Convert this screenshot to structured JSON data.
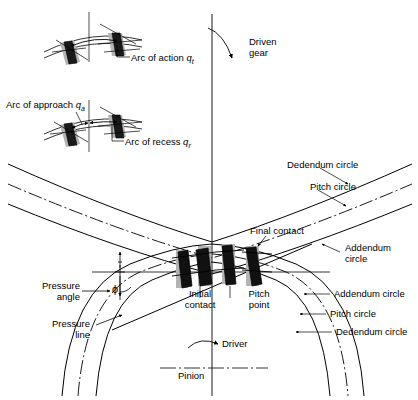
{
  "figure": {
    "ink_color": "#000000",
    "tooth_fill": "#1a1a1a",
    "shade_color": "#b4b4b4"
  },
  "insets": {
    "arc_of_action": {
      "label": "Arc of action ",
      "symbol": "q",
      "subscript": "t"
    },
    "arc_of_approach": {
      "label": "Arc of approach ",
      "symbol": "q",
      "subscript": "a"
    },
    "arc_of_recess": {
      "label": "Arc of recess ",
      "symbol": "q",
      "subscript": "r"
    }
  },
  "main": {
    "driven_gear": "Driven\ngear",
    "driver": "Driver",
    "pinion": "Pinion",
    "final_contact": "Final contact",
    "initial_contact": "Initial\ncontact",
    "pitch_point": "Pitch\npoint",
    "pressure_angle": "Pressure\nangle",
    "pressure_angle_symbol": "ϕ",
    "pressure_line": "Pressure\nline",
    "gear_dedendum_circle": "Dedendum circle",
    "gear_pitch_circle": "Pitch circle",
    "gear_addendum_circle": "Addendum\ncircle",
    "pinion_addendum_circle": "Addendum circle",
    "pinion_pitch_circle": "Pitch circle",
    "pinion_dedendum_circle": "Dedendum circle"
  }
}
